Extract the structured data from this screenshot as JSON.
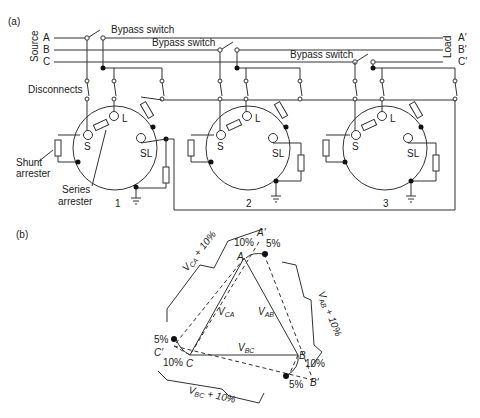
{
  "panel_a": {
    "label": "(a)",
    "source_label": "Source",
    "load_label": "Load",
    "phases_source": [
      "A",
      "B",
      "C"
    ],
    "phases_load": [
      "A′",
      "B′",
      "C′"
    ],
    "bypass_switch_labels": [
      "Bypass switch",
      "Bypass switch",
      "Bypass switch"
    ],
    "disconnects_label": "Disconnects",
    "shunt_arrester_label": [
      "Shunt",
      "arrester"
    ],
    "series_arrester_label": [
      "Series",
      "arrester"
    ],
    "regulators": [
      {
        "number": "1",
        "terminals": [
          "S",
          "L",
          "SL"
        ]
      },
      {
        "number": "2",
        "terminals": [
          "S",
          "L",
          "SL"
        ]
      },
      {
        "number": "3",
        "terminals": [
          "S",
          "L",
          "SL"
        ]
      }
    ]
  },
  "panel_b": {
    "label": "(b)",
    "vertices": [
      "A",
      "B",
      "C"
    ],
    "boosted_vertices": [
      "A′",
      "B′",
      "C′"
    ],
    "phasors": [
      "V_CA",
      "V_AB",
      "V_BC"
    ],
    "phasor_labels": {
      "ca": "V",
      "ca_sub": "CA",
      "ab": "V",
      "ab_sub": "AB",
      "bc": "V",
      "bc_sub": "BC"
    },
    "boost_labels": {
      "ca": "V",
      "ca_sub": "CA",
      "ca_suffix": " + 10%",
      "ab": "V",
      "ab_sub": "AB",
      "ab_suffix": " + 10%",
      "bc": "V",
      "bc_sub": "BC",
      "bc_suffix": " + 10%"
    },
    "percent_labels": {
      "a_10": "10%",
      "a_5": "5%",
      "b_10": "10%",
      "b_5": "5%",
      "c_10": "10%",
      "c_5": "5%"
    }
  }
}
